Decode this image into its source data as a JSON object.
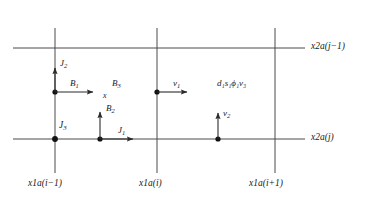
{
  "figure": {
    "type": "finite-difference-grid-stencil",
    "background_color": "#ffffff",
    "line_color": "#4a4a4a",
    "text_color": "#1a1a1a",
    "width": 371,
    "height": 200
  },
  "axis_labels": {
    "top_row": "x2a(j−1)",
    "bottom_row": "x2a(j)"
  },
  "column_labels": [
    "x1a(i−1)",
    "x1a(i)",
    "x1a(i+1)"
  ],
  "vectors": [
    {
      "name": "J2",
      "base": "J",
      "subscript": "2",
      "direction": "up"
    },
    {
      "name": "B1",
      "base": "B",
      "subscript": "1",
      "direction": "right"
    },
    {
      "name": "B2",
      "base": "B",
      "subscript": "2",
      "direction": "up"
    },
    {
      "name": "J1",
      "base": "J",
      "subscript": "1",
      "direction": "right"
    },
    {
      "name": "v1",
      "base": "v",
      "subscript": "1",
      "direction": "right"
    },
    {
      "name": "v2",
      "base": "v",
      "subscript": "2",
      "direction": "up"
    }
  ],
  "point_labels": [
    {
      "name": "J3",
      "base": "J",
      "subscript": "3"
    },
    {
      "name": "B3",
      "base": "B",
      "subscript": "3"
    },
    {
      "name": "x",
      "base": "x",
      "subscript": ""
    }
  ],
  "cell_center_group": {
    "text": "d₁s₁ϕ₁v₃",
    "items": [
      {
        "base": "d",
        "subscript": "1"
      },
      {
        "base": "s",
        "subscript": "1"
      },
      {
        "base": "ϕ",
        "subscript": "1"
      },
      {
        "base": "v",
        "subscript": "3"
      }
    ]
  },
  "geometry": {
    "vertical_lines_x": [
      55,
      157,
      275
    ],
    "horizontal_lines_y": [
      48,
      139
    ],
    "horizontal_extent_x": [
      13,
      305
    ],
    "vertical_extent_y": [
      28,
      173
    ]
  }
}
